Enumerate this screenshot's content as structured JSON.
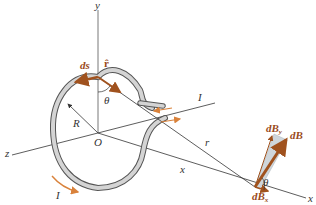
{
  "figure": {
    "type": "physics-diagram",
    "colors": {
      "axis": "#333333",
      "wire_fill": "#d4d4d4",
      "wire_edge": "#555555",
      "vector": "#a0521e",
      "current_arrow": "#d9823b",
      "projection_box": "#cfd6db"
    },
    "labels": {
      "y_axis": "y",
      "z_axis": "z",
      "x_axis": "x",
      "origin": "O",
      "radius": "R",
      "ds": "ds",
      "r_hat": "r̂",
      "theta_loop": "θ",
      "theta_field": "θ",
      "current_lead": "I",
      "current_loop": "I",
      "distance_r": "r",
      "distance_x": "x",
      "dB": "dB",
      "dBy": "dB",
      "dBy_sub": "y",
      "dBx": "dB",
      "dBx_sub": "x"
    }
  }
}
